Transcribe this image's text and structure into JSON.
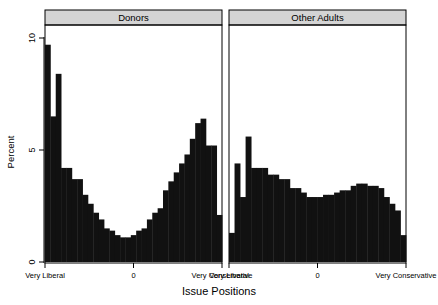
{
  "chart_data": {
    "type": "bar",
    "title": "",
    "subtitle": "",
    "xlabel": "Issue Positions",
    "ylabel": "Percent",
    "ylim": [
      0,
      10.4
    ],
    "yticks": [
      0,
      5,
      10
    ],
    "ytick_labels": [
      "0",
      "5",
      "10"
    ],
    "grid": false,
    "legend": "none",
    "layout": "two side-by-side faceted histogram panels sharing a y axis",
    "xlim": [
      -1,
      1
    ],
    "xticks": [
      -1,
      0,
      1
    ],
    "xtick_labels": [
      "Very Liberal",
      "0",
      "Very Conservative"
    ],
    "panels": [
      {
        "name": "Donors",
        "label": "Donors",
        "nbins": 30,
        "bin_width": 0.0667,
        "values": [
          9.7,
          6.5,
          8.4,
          4.2,
          4.2,
          3.7,
          3.7,
          3.0,
          2.6,
          2.2,
          1.9,
          1.5,
          1.4,
          1.2,
          1.1,
          1.1,
          1.2,
          1.4,
          1.5,
          1.9,
          2.2,
          2.4,
          3.2,
          3.6,
          4.0,
          4.4,
          4.8,
          5.5,
          6.2,
          6.4,
          5.2,
          5.2,
          2.1
        ],
        "bars": [
          {
            "index": 0,
            "x": -1.0,
            "value": 9.7
          },
          {
            "index": 1,
            "x": -0.965,
            "value": 6.5
          },
          {
            "index": 2,
            "x": -0.93,
            "value": 8.4
          },
          {
            "index": 3,
            "x": -0.895,
            "value": 4.2
          },
          {
            "index": 4,
            "x": -0.85,
            "value": 4.2
          },
          {
            "index": 5,
            "x": -0.79,
            "value": 3.7
          },
          {
            "index": 6,
            "x": -0.73,
            "value": 3.7
          },
          {
            "index": 7,
            "x": -0.67,
            "value": 3.0
          },
          {
            "index": 8,
            "x": -0.61,
            "value": 2.6
          },
          {
            "index": 9,
            "x": -0.55,
            "value": 2.2
          },
          {
            "index": 10,
            "x": -0.49,
            "value": 1.9
          },
          {
            "index": 11,
            "x": -0.43,
            "value": 1.5
          },
          {
            "index": 12,
            "x": -0.37,
            "value": 1.4
          },
          {
            "index": 13,
            "x": -0.31,
            "value": 1.2
          },
          {
            "index": 14,
            "x": -0.25,
            "value": 1.1
          },
          {
            "index": 15,
            "x": -0.19,
            "value": 1.1
          },
          {
            "index": 16,
            "x": -0.13,
            "value": 1.2
          },
          {
            "index": 17,
            "x": -0.07,
            "value": 1.4
          },
          {
            "index": 18,
            "x": -0.01,
            "value": 1.5
          },
          {
            "index": 19,
            "x": 0.05,
            "value": 1.9
          },
          {
            "index": 20,
            "x": 0.11,
            "value": 2.2
          },
          {
            "index": 21,
            "x": 0.17,
            "value": 2.4
          },
          {
            "index": 22,
            "x": 0.23,
            "value": 3.2
          },
          {
            "index": 23,
            "x": 0.29,
            "value": 3.6
          },
          {
            "index": 24,
            "x": 0.35,
            "value": 4.0
          },
          {
            "index": 25,
            "x": 0.41,
            "value": 4.4
          },
          {
            "index": 26,
            "x": 0.47,
            "value": 4.8
          },
          {
            "index": 27,
            "x": 0.53,
            "value": 5.5
          },
          {
            "index": 28,
            "x": 0.59,
            "value": 6.2
          },
          {
            "index": 29,
            "x": 0.65,
            "value": 6.4
          },
          {
            "index": 30,
            "x": 0.71,
            "value": 5.2
          },
          {
            "index": 31,
            "x": 0.79,
            "value": 5.2
          },
          {
            "index": 32,
            "x": 0.9,
            "value": 2.1
          }
        ]
      },
      {
        "name": "Other Adults",
        "label": "Other Adults",
        "nbins": 30,
        "bin_width": 0.0667,
        "values": [
          1.3,
          4.4,
          2.9,
          5.6,
          4.2,
          4.2,
          3.9,
          3.9,
          3.7,
          3.7,
          3.3,
          3.3,
          3.1,
          3.1,
          2.9,
          2.9,
          2.9,
          3.0,
          3.0,
          3.1,
          3.2,
          3.2,
          3.4,
          3.5,
          3.5,
          3.4,
          3.3,
          2.9,
          2.6,
          2.3,
          1.2
        ],
        "bars": [
          {
            "index": 0,
            "x": -1.0,
            "value": 1.3
          },
          {
            "index": 1,
            "x": -0.955,
            "value": 4.4
          },
          {
            "index": 2,
            "x": -0.91,
            "value": 2.9
          },
          {
            "index": 3,
            "x": -0.865,
            "value": 5.6
          },
          {
            "index": 4,
            "x": -0.82,
            "value": 4.2
          },
          {
            "index": 5,
            "x": -0.76,
            "value": 4.2
          },
          {
            "index": 6,
            "x": -0.7,
            "value": 4.2
          },
          {
            "index": 7,
            "x": -0.64,
            "value": 3.9
          },
          {
            "index": 8,
            "x": -0.58,
            "value": 3.9
          },
          {
            "index": 9,
            "x": -0.52,
            "value": 3.7
          },
          {
            "index": 10,
            "x": -0.46,
            "value": 3.7
          },
          {
            "index": 11,
            "x": -0.4,
            "value": 3.3
          },
          {
            "index": 12,
            "x": -0.34,
            "value": 3.3
          },
          {
            "index": 13,
            "x": -0.28,
            "value": 3.1
          },
          {
            "index": 14,
            "x": -0.22,
            "value": 2.9
          },
          {
            "index": 15,
            "x": -0.16,
            "value": 2.9
          },
          {
            "index": 16,
            "x": -0.1,
            "value": 2.9
          },
          {
            "index": 17,
            "x": -0.04,
            "value": 3.0
          },
          {
            "index": 18,
            "x": 0.02,
            "value": 3.0
          },
          {
            "index": 19,
            "x": 0.08,
            "value": 3.1
          },
          {
            "index": 20,
            "x": 0.14,
            "value": 3.2
          },
          {
            "index": 21,
            "x": 0.2,
            "value": 3.2
          },
          {
            "index": 22,
            "x": 0.26,
            "value": 3.4
          },
          {
            "index": 23,
            "x": 0.32,
            "value": 3.5
          },
          {
            "index": 24,
            "x": 0.38,
            "value": 3.5
          },
          {
            "index": 25,
            "x": 0.44,
            "value": 3.4
          },
          {
            "index": 26,
            "x": 0.5,
            "value": 3.4
          },
          {
            "index": 27,
            "x": 0.56,
            "value": 3.3
          },
          {
            "index": 28,
            "x": 0.62,
            "value": 2.9
          },
          {
            "index": 29,
            "x": 0.7,
            "value": 2.6
          },
          {
            "index": 30,
            "x": 0.78,
            "value": 2.3
          },
          {
            "index": 31,
            "x": 0.88,
            "value": 1.2
          }
        ]
      }
    ],
    "colors": {
      "bar": "#111111",
      "strip_background": "#d4d4d4",
      "panel_border": "#000000",
      "background": "#ffffff"
    }
  }
}
